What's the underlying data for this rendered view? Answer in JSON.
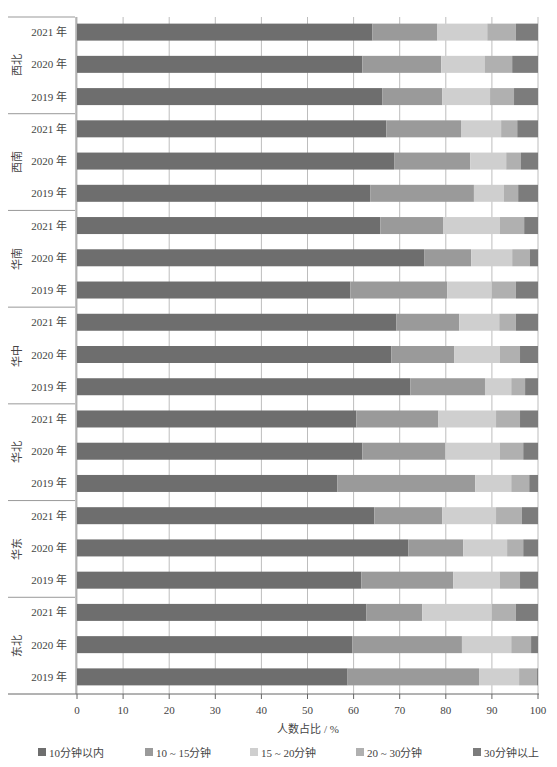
{
  "chart_data": {
    "type": "bar",
    "orientation": "horizontal",
    "stacked": true,
    "title": "",
    "xlabel": "人数占比 / %",
    "ylabel": "",
    "xlim": [
      0,
      100
    ],
    "xticks": [
      0,
      10,
      20,
      30,
      40,
      50,
      60,
      70,
      80,
      90,
      100
    ],
    "grid": true,
    "legend_position": "bottom",
    "groups": [
      "西北",
      "西南",
      "华南",
      "华中",
      "华北",
      "华东",
      "东北"
    ],
    "years": [
      "2021 年",
      "2020 年",
      "2019 年"
    ],
    "series": [
      {
        "name": "10分钟以内",
        "color": "#6e6e6e"
      },
      {
        "name": "10 ~ 15分钟",
        "color": "#9a9a9a"
      },
      {
        "name": "15 ~ 20分钟",
        "color": "#cfcfcf"
      },
      {
        "name": "20 ~ 30分钟",
        "color": "#b0b0b0"
      },
      {
        "name": "30分钟以上",
        "color": "#7c7c7c"
      }
    ],
    "rows": [
      {
        "group": "西北",
        "year": "2021 年",
        "values": [
          64.1,
          14.0,
          10.9,
          6.2,
          4.8
        ]
      },
      {
        "group": "西北",
        "year": "2020 年",
        "values": [
          61.9,
          17.1,
          9.5,
          5.9,
          5.6
        ]
      },
      {
        "group": "西北",
        "year": "2019 年",
        "values": [
          66.2,
          13.0,
          10.4,
          5.2,
          5.2
        ]
      },
      {
        "group": "西南",
        "year": "2021 年",
        "values": [
          67.1,
          16.2,
          8.7,
          3.5,
          4.5
        ]
      },
      {
        "group": "西南",
        "year": "2020 年",
        "values": [
          68.8,
          16.5,
          7.8,
          3.2,
          3.7
        ]
      },
      {
        "group": "西南",
        "year": "2019 年",
        "values": [
          63.6,
          22.5,
          6.5,
          3.1,
          4.3
        ]
      },
      {
        "group": "华南",
        "year": "2021 年",
        "values": [
          65.8,
          13.6,
          12.3,
          5.3,
          3.0
        ]
      },
      {
        "group": "华南",
        "year": "2020 年",
        "values": [
          75.3,
          10.2,
          8.9,
          3.8,
          1.8
        ]
      },
      {
        "group": "华南",
        "year": "2019 年",
        "values": [
          59.3,
          21.0,
          9.7,
          5.2,
          4.8
        ]
      },
      {
        "group": "华中",
        "year": "2021 年",
        "values": [
          69.3,
          13.6,
          8.7,
          3.6,
          4.8
        ]
      },
      {
        "group": "华中",
        "year": "2020 年",
        "values": [
          68.2,
          13.6,
          9.9,
          4.4,
          3.9
        ]
      },
      {
        "group": "华中",
        "year": "2019 年",
        "values": [
          72.3,
          16.2,
          5.7,
          3.0,
          2.8
        ]
      },
      {
        "group": "华北",
        "year": "2021 年",
        "values": [
          60.6,
          17.8,
          12.5,
          5.2,
          3.9
        ]
      },
      {
        "group": "华北",
        "year": "2020 年",
        "values": [
          61.9,
          18.0,
          11.8,
          5.1,
          3.2
        ]
      },
      {
        "group": "华北",
        "year": "2019 年",
        "values": [
          56.5,
          29.9,
          7.8,
          3.9,
          1.9
        ]
      },
      {
        "group": "华东",
        "year": "2021 年",
        "values": [
          64.5,
          14.7,
          11.7,
          5.6,
          3.5
        ]
      },
      {
        "group": "华东",
        "year": "2020 年",
        "values": [
          71.9,
          11.9,
          9.5,
          3.5,
          3.2
        ]
      },
      {
        "group": "华东",
        "year": "2019 年",
        "values": [
          61.7,
          19.9,
          10.1,
          4.4,
          3.9
        ]
      },
      {
        "group": "东北",
        "year": "2021 年",
        "values": [
          62.8,
          12.1,
          15.1,
          5.2,
          4.8
        ]
      },
      {
        "group": "东北",
        "year": "2020 年",
        "values": [
          59.7,
          23.8,
          10.7,
          4.3,
          1.5
        ]
      },
      {
        "group": "东北",
        "year": "2019 年",
        "values": [
          58.7,
          28.5,
          8.7,
          3.9,
          0.2
        ]
      }
    ]
  }
}
